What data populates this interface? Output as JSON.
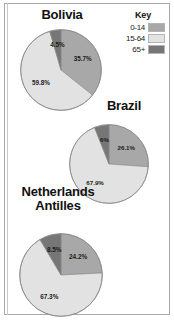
{
  "legend": {
    "title": "Key",
    "entries": [
      {
        "label": "0-14",
        "color": "#a8a8a8"
      },
      {
        "label": "15-64",
        "color": "#e2e2e2"
      },
      {
        "label": "65+",
        "color": "#767676"
      }
    ]
  },
  "charts": [
    {
      "title": "Bolivia"
    },
    {
      "title": "Brazil"
    },
    {
      "title": "Netherlands Antilles"
    }
  ],
  "chart_data": [
    {
      "type": "pie",
      "title": "Bolivia",
      "categories": [
        "0-14",
        "15-64",
        "65+"
      ],
      "values": [
        35.7,
        59.8,
        4.5
      ],
      "labels": [
        "35.7%",
        "59.8%",
        "4.5%"
      ],
      "colors": [
        "#a8a8a8",
        "#e2e2e2",
        "#767676"
      ],
      "units": "percent",
      "start_angle_deg": 0,
      "direction": "clockwise",
      "legend_position": "top-right"
    },
    {
      "type": "pie",
      "title": "Brazil",
      "categories": [
        "0-14",
        "15-64",
        "65+"
      ],
      "values": [
        26.1,
        67.9,
        6.0
      ],
      "labels": [
        "26.1%",
        "67.9%",
        "6%"
      ],
      "colors": [
        "#a8a8a8",
        "#e2e2e2",
        "#767676"
      ],
      "units": "percent",
      "start_angle_deg": 0,
      "direction": "clockwise",
      "legend_position": "top-right"
    },
    {
      "type": "pie",
      "title": "Netherlands Antilles",
      "categories": [
        "0-14",
        "15-64",
        "65+"
      ],
      "values": [
        24.2,
        67.3,
        8.5
      ],
      "labels": [
        "24.2%",
        "67.3%",
        "8.5%"
      ],
      "colors": [
        "#a8a8a8",
        "#e2e2e2",
        "#767676"
      ],
      "units": "percent",
      "start_angle_deg": 0,
      "direction": "clockwise",
      "legend_position": "top-right"
    }
  ]
}
